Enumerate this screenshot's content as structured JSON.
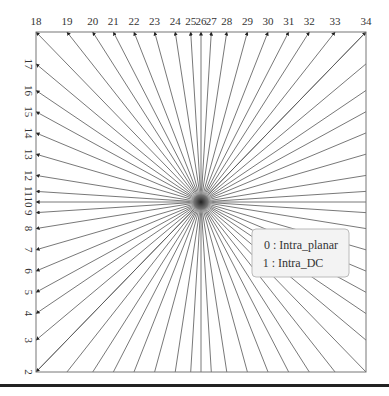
{
  "diagram": {
    "top_labels": [
      "18",
      "19",
      "20",
      "21",
      "22",
      "23",
      "24",
      "25",
      "26",
      "27",
      "28",
      "29",
      "30",
      "31",
      "32",
      "33",
      "34"
    ],
    "left_labels": [
      "17",
      "16",
      "15",
      "14",
      "13",
      "12",
      "11",
      "10",
      "9",
      "8",
      "7",
      "6",
      "5",
      "4",
      "3",
      "2"
    ],
    "angle_offsets": [
      -32,
      -26,
      -21,
      -17,
      -13,
      -9,
      -5,
      -2,
      0,
      2,
      5,
      9,
      13,
      17,
      21,
      26,
      32
    ],
    "legend": {
      "items": [
        "0 : Intra_planar",
        "1 : Intra_DC"
      ]
    },
    "colors": {
      "line": "#555555",
      "frame": "#777777",
      "legend_fill": "#f3f3f3",
      "legend_border": "#bbbbbb",
      "center": "#333333"
    }
  }
}
